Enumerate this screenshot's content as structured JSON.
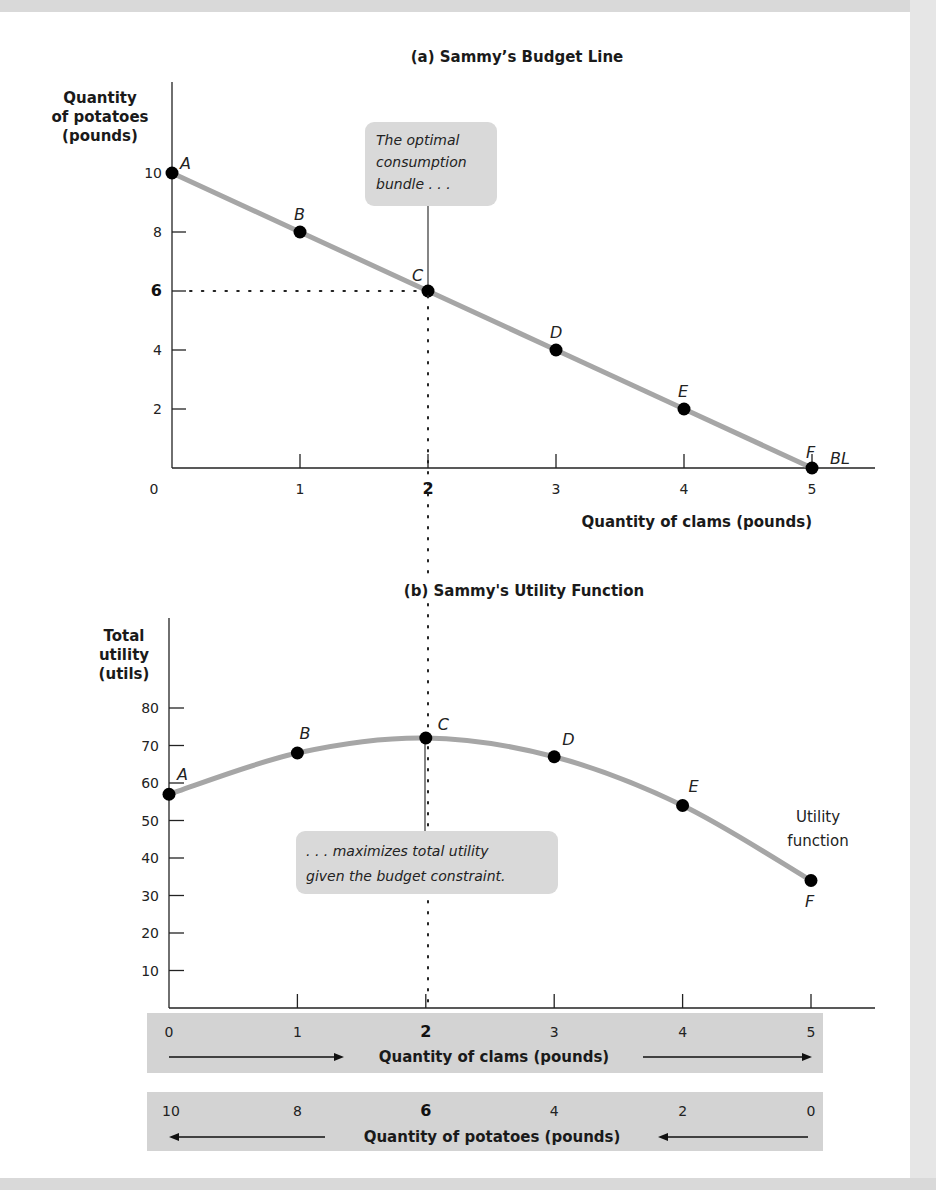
{
  "chart_data": [
    {
      "type": "line",
      "title": "(a) Sammy’s Budget Line",
      "xlabel": "Quantity of clams (pounds)",
      "ylabel": [
        "Quantity",
        "of potatoes",
        "(pounds)"
      ],
      "x_ticks": [
        "0",
        "1",
        "2",
        "3",
        "4",
        "5"
      ],
      "y_ticks": [
        "2",
        "4",
        "6",
        "8",
        "10"
      ],
      "xlim": [
        0,
        5.5
      ],
      "ylim": [
        0,
        12
      ],
      "grid": false,
      "series": [
        {
          "name": "BL",
          "points": [
            {
              "label": "A",
              "x": 0,
              "y": 10
            },
            {
              "label": "B",
              "x": 1,
              "y": 8
            },
            {
              "label": "C",
              "x": 2,
              "y": 6
            },
            {
              "label": "D",
              "x": 3,
              "y": 4
            },
            {
              "label": "E",
              "x": 4,
              "y": 2
            },
            {
              "label": "F",
              "x": 5,
              "y": 0
            }
          ]
        }
      ],
      "line_label": "BL",
      "annotation": [
        "The optimal",
        "consumption",
        "bundle . . ."
      ],
      "highlight": {
        "x": 2,
        "y": 6
      }
    },
    {
      "type": "line",
      "title": "(b) Sammy's Utility Function",
      "xlabel": "Quantity of clams (pounds)",
      "ylabel": [
        "Total",
        "utility",
        "(utils)"
      ],
      "y_ticks": [
        "10",
        "20",
        "30",
        "40",
        "50",
        "60",
        "70",
        "80"
      ],
      "xlim": [
        0,
        5.5
      ],
      "ylim": [
        0,
        90
      ],
      "grid": false,
      "series": [
        {
          "name": "Utility function",
          "points": [
            {
              "label": "A",
              "x": 0,
              "y": 57
            },
            {
              "label": "B",
              "x": 1,
              "y": 68
            },
            {
              "label": "C",
              "x": 2,
              "y": 72
            },
            {
              "label": "D",
              "x": 3,
              "y": 67
            },
            {
              "label": "E",
              "x": 4,
              "y": 54
            },
            {
              "label": "F",
              "x": 5,
              "y": 34
            }
          ]
        }
      ],
      "curve_label": [
        "Utility",
        "function"
      ],
      "annotation": [
        ". . . maximizes total utility",
        "given the budget constraint."
      ],
      "bottom_axes": {
        "clams": {
          "label": "Quantity of clams (pounds)",
          "ticks": [
            "0",
            "1",
            "2",
            "3",
            "4",
            "5"
          ],
          "direction": "right"
        },
        "potatoes": {
          "label": "Quantity of potatoes (pounds)",
          "ticks": [
            "10",
            "8",
            "6",
            "4",
            "2",
            "0"
          ],
          "direction": "left"
        }
      }
    }
  ],
  "colors": {
    "curve": "#a6a6a6",
    "point": "#000000",
    "callout": "#d9d9d9",
    "strip": "#d3d3d3",
    "axis": "#222222"
  }
}
